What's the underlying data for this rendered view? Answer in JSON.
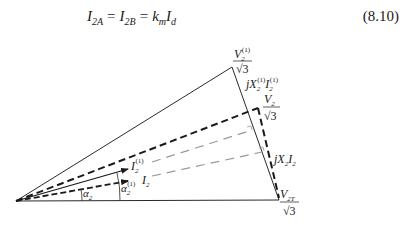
{
  "equation": {
    "lhs1": "I",
    "lhs1_sub": "2A",
    "eq1": "=",
    "lhs2": "I",
    "lhs2_sub": "2B",
    "eq2": "=",
    "rhs_k": "k",
    "rhs_k_sub": "m",
    "rhs_i": "I",
    "rhs_i_sub": "d",
    "number": "(8.10)"
  },
  "diagram": {
    "labels": {
      "v21_num": "V",
      "v21_sub": "2",
      "v21_sup": "(1)",
      "v21_den": "√3",
      "jx21_j": "jX",
      "jx21_sub": "2",
      "jx21_sup": "(1)",
      "jx21_i": "I",
      "jx21_i_sub": "2",
      "jx21_i_sup": "(1)",
      "v2_num": "V",
      "v2_sub": "2",
      "v2_den": "√3",
      "jx2_j": "jX",
      "jx2_sub": "2",
      "jx2_i": "I",
      "jx2_i_sub": "2",
      "v2t_num": "V",
      "v2t_sub": "2T",
      "v2t_den": "√3",
      "i21": "I",
      "i21_sub": "2",
      "i21_sup": "(1)",
      "i2": "I",
      "i2_sub": "2",
      "alpha2": "α",
      "alpha2_sub": "2",
      "alpha21": "α",
      "alpha21_sub": "2",
      "alpha21_sup": "(1)"
    },
    "colors": {
      "line": "#2a2a2a",
      "gray_dash": "#9a9a9a"
    }
  }
}
